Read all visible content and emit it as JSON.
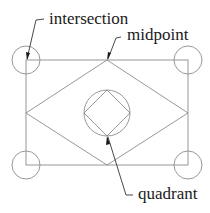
{
  "diagram": {
    "labels": {
      "intersection": "intersection",
      "midpoint": "midpoint",
      "quadrant": "quadrant"
    },
    "colors": {
      "geometry": "#8c8c8c",
      "leader": "#333333",
      "text": "#1a1a1a",
      "background": "#ffffff"
    }
  }
}
